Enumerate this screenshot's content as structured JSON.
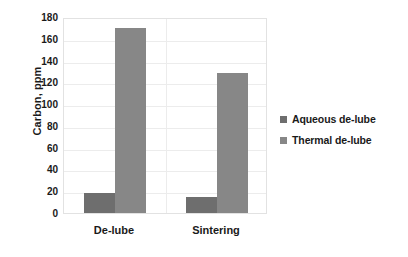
{
  "chart_data": {
    "type": "bar",
    "title": "",
    "xlabel": "",
    "ylabel": "Carbon, ppm",
    "categories": [
      "De-lube",
      "Sintering"
    ],
    "series": [
      {
        "name": "Aqueous de-lube",
        "color": "#6e6e6e",
        "values": [
          18,
          15
        ]
      },
      {
        "name": "Thermal de-lube",
        "color": "#878787",
        "values": [
          170,
          129
        ]
      }
    ],
    "ylim": [
      0,
      180
    ],
    "yticks": [
      0,
      20,
      40,
      60,
      80,
      100,
      120,
      140,
      160,
      180
    ],
    "ytick_labels": [
      "0",
      "20",
      "40",
      "60",
      "80",
      "100",
      "120",
      "140",
      "160",
      "180"
    ],
    "grid": "horizontal",
    "legend_position": "right",
    "plot_border_color": "#e2e2e2",
    "gridline_color": "#ececec",
    "background_color": "#ffffff"
  }
}
